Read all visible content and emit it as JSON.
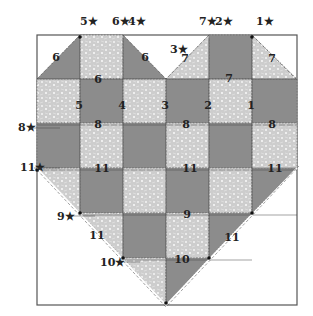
{
  "diagram": {
    "frame": {
      "x": 37,
      "y": 35,
      "w": 260,
      "h": 270
    },
    "colors": {
      "dark": "#8c8c8c",
      "light": "#cdcdcd",
      "speckle": "#f2f2f2",
      "line": "#333333",
      "frame": "#555555"
    },
    "grid": {
      "cols": [
        37,
        80,
        123,
        166,
        209,
        252,
        297
      ],
      "rows": [
        35,
        79,
        123,
        168,
        213,
        258,
        305
      ],
      "cells": [
        [
          "tri-dark-ul-white",
          "light",
          "tri-dark-ur-white",
          "tri-light-ul-white",
          "dark",
          "tri-light-ur-white"
        ],
        [
          "light",
          "dark",
          "light",
          "dark",
          "light",
          "dark"
        ],
        [
          "dark",
          "light",
          "dark",
          "light",
          "dark",
          "light"
        ],
        [
          "tri-light-ll-white",
          "dark",
          "light",
          "dark",
          "light",
          "tri-dark-lr-white"
        ],
        [
          "white",
          "tri-light-ll-white",
          "dark",
          "light",
          "tri-dark-lr-white",
          "white"
        ],
        [
          "white",
          "white",
          "tri-light-ll-white",
          "tri-dark-lr-white",
          "white",
          "white"
        ]
      ]
    },
    "start_labels": [
      {
        "text": "5★",
        "x": 80,
        "y": 25
      },
      {
        "text": "6★",
        "x": 112,
        "y": 25
      },
      {
        "text": "4★",
        "x": 128,
        "y": 25
      },
      {
        "text": "3★",
        "x": 170,
        "y": 53
      },
      {
        "text": "7★",
        "x": 199,
        "y": 25
      },
      {
        "text": "2★",
        "x": 215,
        "y": 25
      },
      {
        "text": "1★",
        "x": 256,
        "y": 25
      },
      {
        "text": "8★",
        "x": 18,
        "y": 131
      },
      {
        "text": "11★",
        "x": 20,
        "y": 171
      },
      {
        "text": "9★",
        "x": 57,
        "y": 220
      },
      {
        "text": "10★",
        "x": 100,
        "y": 266
      }
    ],
    "seam_labels": [
      {
        "text": "6",
        "x": 56,
        "y": 61
      },
      {
        "text": "6",
        "x": 98,
        "y": 83
      },
      {
        "text": "6",
        "x": 145,
        "y": 61
      },
      {
        "text": "7",
        "x": 185,
        "y": 62
      },
      {
        "text": "7",
        "x": 229,
        "y": 82
      },
      {
        "text": "7",
        "x": 272,
        "y": 62
      },
      {
        "text": "5",
        "x": 79,
        "y": 109
      },
      {
        "text": "4",
        "x": 122,
        "y": 109
      },
      {
        "text": "3",
        "x": 165,
        "y": 109
      },
      {
        "text": "2",
        "x": 208,
        "y": 109
      },
      {
        "text": "1",
        "x": 251,
        "y": 109
      },
      {
        "text": "8",
        "x": 98,
        "y": 128
      },
      {
        "text": "8",
        "x": 186,
        "y": 128
      },
      {
        "text": "8",
        "x": 272,
        "y": 128
      },
      {
        "text": "11",
        "x": 102,
        "y": 172
      },
      {
        "text": "11",
        "x": 190,
        "y": 172
      },
      {
        "text": "11",
        "x": 275,
        "y": 172
      },
      {
        "text": "9",
        "x": 187,
        "y": 218
      },
      {
        "text": "11",
        "x": 97,
        "y": 239
      },
      {
        "text": "11",
        "x": 232,
        "y": 241
      },
      {
        "text": "10",
        "x": 182,
        "y": 263
      }
    ]
  }
}
